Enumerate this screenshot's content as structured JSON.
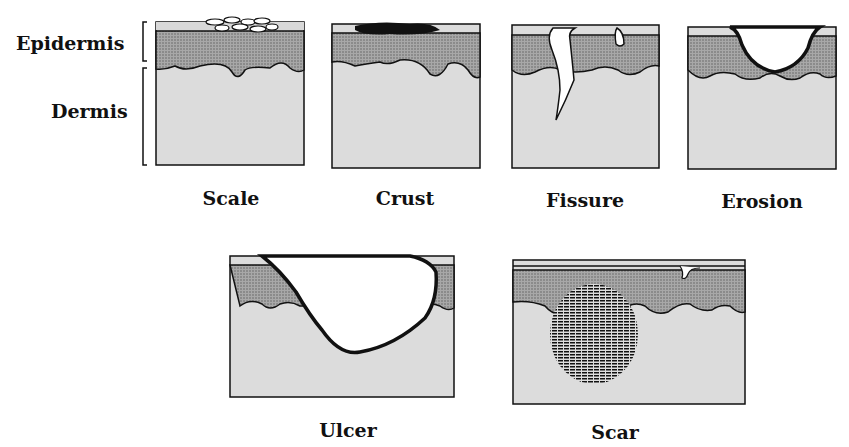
{
  "layer_labels": {
    "epidermis": "Epidermis",
    "dermis": "Dermis"
  },
  "panels": [
    {
      "id": "scale",
      "label": "Scale"
    },
    {
      "id": "crust",
      "label": "Crust"
    },
    {
      "id": "fissure",
      "label": "Fissure"
    },
    {
      "id": "erosion",
      "label": "Erosion"
    },
    {
      "id": "ulcer",
      "label": "Ulcer"
    },
    {
      "id": "scar",
      "label": "Scar"
    }
  ],
  "colors": {
    "epidermis_fill": "#9a9a9a",
    "dermis_fill": "#dcdcdc",
    "stratum_fill": "#d8d8d8",
    "outline": "#111111"
  }
}
